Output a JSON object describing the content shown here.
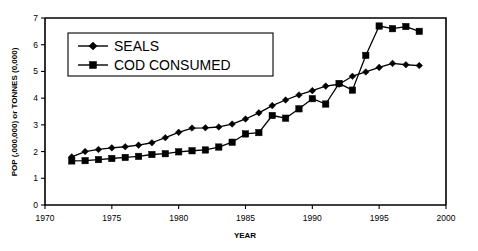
{
  "chart_data": {
    "type": "line",
    "title": "",
    "xlabel": "YEAR",
    "ylabel": "POP (,000,000) or TONNES (0,000)",
    "xlim": [
      1970,
      2000
    ],
    "ylim": [
      0,
      7
    ],
    "xticks": [
      1970,
      1975,
      1980,
      1985,
      1990,
      1995,
      2000
    ],
    "yticks": [
      0,
      1,
      2,
      3,
      4,
      5,
      6,
      7
    ],
    "grid": false,
    "legend_position": "upper-left-inside",
    "x": [
      1972,
      1973,
      1974,
      1975,
      1976,
      1977,
      1978,
      1979,
      1980,
      1981,
      1982,
      1983,
      1984,
      1985,
      1986,
      1987,
      1988,
      1989,
      1990,
      1991,
      1992,
      1993,
      1994,
      1995,
      1996,
      1997,
      1998
    ],
    "series": [
      {
        "name": "SEALS",
        "marker": "diamond",
        "values": [
          1.8,
          2.0,
          2.08,
          2.14,
          2.18,
          2.24,
          2.33,
          2.52,
          2.72,
          2.88,
          2.89,
          2.92,
          3.03,
          3.22,
          3.45,
          3.72,
          3.93,
          4.12,
          4.28,
          4.45,
          4.52,
          4.82,
          4.98,
          5.15,
          5.3,
          5.25,
          5.22
        ]
      },
      {
        "name": "COD CONSUMED",
        "marker": "square",
        "values": [
          1.65,
          1.66,
          1.7,
          1.74,
          1.78,
          1.82,
          1.89,
          1.92,
          1.99,
          2.03,
          2.06,
          2.17,
          2.35,
          2.66,
          2.71,
          3.35,
          3.25,
          3.6,
          3.98,
          3.78,
          4.55,
          4.3,
          5.6,
          6.7,
          6.6,
          6.68,
          6.5
        ]
      }
    ],
    "legend_entries": [
      "SEALS",
      "COD CONSUMED"
    ]
  },
  "axis": {
    "x_tick_labels": [
      "1970",
      "1975",
      "1980",
      "1985",
      "1990",
      "1995",
      "2000"
    ],
    "y_tick_labels": [
      "0",
      "1",
      "2",
      "3",
      "4",
      "5",
      "6",
      "7"
    ],
    "x_title": "YEAR",
    "y_title": "POP (,000,000) or TONNES (0,000)"
  },
  "legend": {
    "entries": [
      {
        "label": "SEALS",
        "marker": "diamond-marker"
      },
      {
        "label": "COD CONSUMED",
        "marker": "square-marker"
      }
    ]
  },
  "colors": {
    "line": "#000000",
    "background": "#ffffff",
    "frame": "#000000"
  }
}
